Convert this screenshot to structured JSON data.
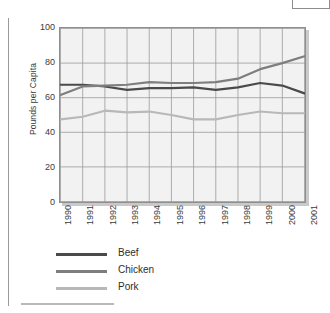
{
  "figure": {
    "y_axis_title": "Pounds per Capita"
  },
  "chart_data": {
    "type": "line",
    "title": "",
    "subtitle": "",
    "xlabel": "",
    "ylabel": "Pounds per Capita",
    "categories": [
      "1990",
      "1991",
      "1992",
      "1993",
      "1994",
      "1995",
      "1996",
      "1997",
      "1998",
      "1999",
      "2000",
      "2001"
    ],
    "x": [
      1990,
      1991,
      1992,
      1993,
      1994,
      1995,
      1996,
      1997,
      1998,
      1999,
      2000,
      2001
    ],
    "xlim": [
      1990,
      2001
    ],
    "ylim": [
      0,
      100
    ],
    "yticks": [
      0,
      20,
      40,
      60,
      80,
      100
    ],
    "ytick_labels": [
      "0",
      "20",
      "40",
      "60",
      "80",
      "100"
    ],
    "grid": true,
    "legend_position": "below",
    "series": [
      {
        "name": "Beef",
        "color": "#4a4a4a",
        "values": [
          67.5,
          67.5,
          66.5,
          64.5,
          65.5,
          65.5,
          66,
          64.5,
          66,
          68.5,
          67,
          62.5
        ]
      },
      {
        "name": "Chicken",
        "color": "#7e7e7e",
        "values": [
          61.5,
          66.5,
          67,
          67.5,
          69,
          68.5,
          68.5,
          69,
          71,
          76.5,
          80,
          84
        ]
      },
      {
        "name": "Pork",
        "color": "#b8b8b8",
        "values": [
          47.5,
          49,
          52.5,
          51.5,
          52,
          50,
          47.5,
          47.5,
          50,
          52,
          51,
          51
        ]
      }
    ]
  },
  "legend": {
    "items": [
      {
        "label": "Beef"
      },
      {
        "label": "Chicken"
      },
      {
        "label": "Pork"
      }
    ]
  }
}
